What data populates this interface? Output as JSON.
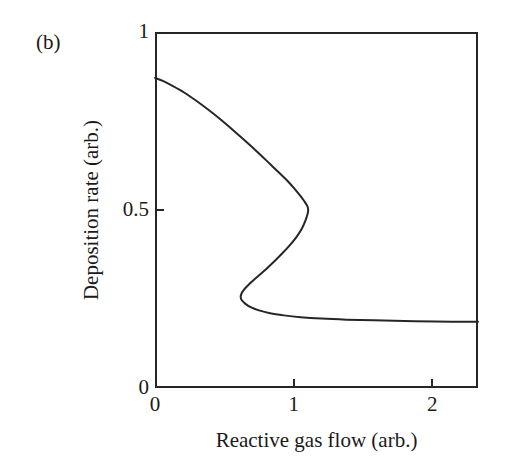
{
  "panel": {
    "label": "(b)"
  },
  "chart_data": {
    "type": "line",
    "title": "",
    "subtitle": "",
    "panel_label": "(b)",
    "xlabel": "Reactive gas flow (arb.)",
    "ylabel": "Deposition rate (arb.)",
    "xlim": [
      0,
      2.33
    ],
    "ylim": [
      0,
      1
    ],
    "xticks": [
      0,
      1,
      2
    ],
    "xticklabels": [
      "0",
      "1",
      "2"
    ],
    "yticks": [
      0,
      0.5,
      1
    ],
    "yticklabels": [
      "0",
      "0.5",
      "1"
    ],
    "grid": false,
    "legend": null,
    "line_color": "#262626",
    "line_width": 2,
    "series": [
      {
        "name": "Deposition rate",
        "curve_style": "s-curve-multivalued",
        "points": [
          [
            0.0,
            0.871
          ],
          [
            0.06,
            0.862
          ],
          [
            0.13,
            0.848
          ],
          [
            0.21,
            0.83
          ],
          [
            0.3,
            0.806
          ],
          [
            0.39,
            0.78
          ],
          [
            0.48,
            0.752
          ],
          [
            0.57,
            0.722
          ],
          [
            0.66,
            0.691
          ],
          [
            0.75,
            0.659
          ],
          [
            0.83,
            0.629
          ],
          [
            0.9,
            0.603
          ],
          [
            0.96,
            0.58
          ],
          [
            1.01,
            0.558
          ],
          [
            1.05,
            0.539
          ],
          [
            1.08,
            0.523
          ],
          [
            1.1,
            0.51
          ],
          [
            1.105,
            0.5
          ],
          [
            1.1,
            0.488
          ],
          [
            1.085,
            0.47
          ],
          [
            1.06,
            0.448
          ],
          [
            1.02,
            0.424
          ],
          [
            0.97,
            0.4
          ],
          [
            0.91,
            0.375
          ],
          [
            0.85,
            0.352
          ],
          [
            0.79,
            0.33
          ],
          [
            0.73,
            0.31
          ],
          [
            0.68,
            0.292
          ],
          [
            0.645,
            0.278
          ],
          [
            0.625,
            0.266
          ],
          [
            0.618,
            0.256
          ],
          [
            0.625,
            0.247
          ],
          [
            0.65,
            0.237
          ],
          [
            0.69,
            0.227
          ],
          [
            0.75,
            0.218
          ],
          [
            0.83,
            0.21
          ],
          [
            0.93,
            0.204
          ],
          [
            1.05,
            0.199
          ],
          [
            1.2,
            0.195
          ],
          [
            1.38,
            0.192
          ],
          [
            1.58,
            0.19
          ],
          [
            1.8,
            0.188
          ],
          [
            2.02,
            0.187
          ],
          [
            2.18,
            0.186
          ],
          [
            2.33,
            0.186
          ]
        ]
      }
    ],
    "annotations": [
      {
        "name": "upper-branch-start",
        "x": 0.0,
        "y": 0.871
      },
      {
        "name": "upper-turning-point",
        "x": 1.105,
        "y": 0.5
      },
      {
        "name": "lower-turning-point",
        "x": 0.618,
        "y": 0.256
      },
      {
        "name": "lower-branch-end",
        "x": 2.33,
        "y": 0.186
      }
    ]
  }
}
